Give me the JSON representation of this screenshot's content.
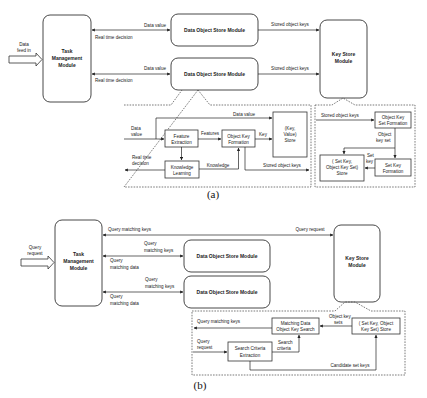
{
  "figure_a": {
    "caption": "(a)",
    "input_arrow_label": [
      "Data",
      "feed in"
    ],
    "task_management": [
      "Task",
      "Management",
      "Module"
    ],
    "data_object_store_1": "Data Object Store Module",
    "data_object_store_2": "Data Object Store Module",
    "key_store": [
      "Key Store",
      "Module"
    ],
    "edges": {
      "data_value_1": "Data value",
      "real_time_decision_1": "Real time decision",
      "data_value_2": "Data value",
      "real_time_decision_2": "Real time decision",
      "stored_object_keys_1": "Stored object keys",
      "stored_object_keys_2": "Stored object keys"
    },
    "dos_detail": {
      "data_value_in": [
        "Data",
        "value"
      ],
      "data_value_top": "Data value",
      "feature_extraction": [
        "Feature",
        "Extraction"
      ],
      "features": "Features",
      "object_key_formation": [
        "Object Key",
        "Formation"
      ],
      "key": "Key",
      "kv_store": [
        "(Key,",
        "Value)",
        "Store"
      ],
      "real_time_decision": [
        "Real time",
        "decision"
      ],
      "knowledge_learning": [
        "Knowledge",
        "Learning"
      ],
      "knowledge": "Knowledge",
      "stored_object_keys": "Stored object keys"
    },
    "ks_detail": {
      "stored_object_keys": "Stored object keys",
      "object_key_set_formation": [
        "Object Key",
        "Set Formation"
      ],
      "object_key_set": [
        "Object",
        "key set"
      ],
      "set_key": [
        "Set",
        "key"
      ],
      "set_key_formation": [
        "Set Key",
        "Formation"
      ],
      "set_key_store": [
        "( Set Key,",
        "Object Key Set)",
        "Store"
      ]
    }
  },
  "figure_b": {
    "caption": "(b)",
    "input_arrow_label": [
      "Query",
      "request"
    ],
    "task_management": [
      "Task",
      "Management",
      "Module"
    ],
    "data_object_store_1": "Data Object Store Module",
    "data_object_store_2": "Data Object Store Module",
    "key_store": [
      "Key Store",
      "Module"
    ],
    "edges": {
      "query_matching_keys_top": "Query matching keys",
      "query_request_top": "Query request",
      "query_matching_keys_1": [
        "Query",
        "matching keys"
      ],
      "query_matching_data_1": [
        "Query",
        "matching data"
      ],
      "query_matching_keys_2": [
        "Query",
        "matching keys"
      ],
      "query_matching_data_2": [
        "Query",
        "matching data"
      ]
    },
    "ks_detail": {
      "query_matching_keys": "Query matching keys",
      "matching_data_search": [
        "Matching Data",
        "Object Key Search"
      ],
      "object_key_sets": [
        "Object key",
        "sets"
      ],
      "set_key_store": [
        "( Set Key, Object",
        "Key Set) Store"
      ],
      "query_request": [
        "Query",
        "request"
      ],
      "search_criteria_extraction": [
        "Search Criteria",
        "Extraction"
      ],
      "search_criteria": [
        "Search",
        "criteria"
      ],
      "candidate_set_keys": "Candidate set keys"
    }
  }
}
